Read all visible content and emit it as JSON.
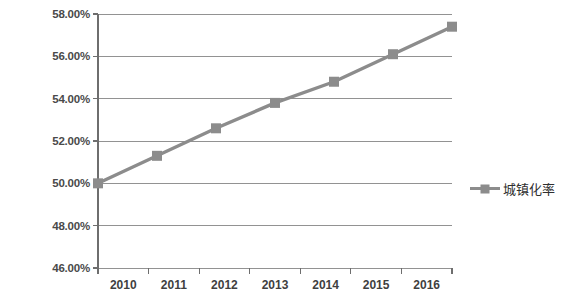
{
  "chart_data": {
    "type": "line",
    "title": "",
    "xlabel": "",
    "ylabel": "",
    "categories": [
      "2010",
      "2011",
      "2012",
      "2013",
      "2014",
      "2015",
      "2016"
    ],
    "series": [
      {
        "name": "城镇化率",
        "values": [
          50.0,
          51.3,
          52.6,
          53.8,
          54.8,
          56.1,
          57.4
        ],
        "color": "#8c8c8c",
        "marker": "square"
      }
    ],
    "ylim": [
      46,
      58
    ],
    "ytick_step": 2,
    "ytick_labels": [
      "58.00%",
      "56.00%",
      "54.00%",
      "52.00%",
      "50.00%",
      "48.00%",
      "46.00%"
    ],
    "ytick_values": [
      58,
      56,
      54,
      52,
      50,
      48,
      46
    ],
    "grid": true,
    "grid_axis": "y",
    "legend_position": "right",
    "value_format": "percent"
  },
  "legend": {
    "entries": [
      {
        "label": "城镇化率"
      }
    ]
  },
  "colors": {
    "series": "#8c8c8c",
    "grid": "#808080",
    "axis": "#6e6e6e",
    "text": "#3f3f3f",
    "background": "#ffffff"
  }
}
